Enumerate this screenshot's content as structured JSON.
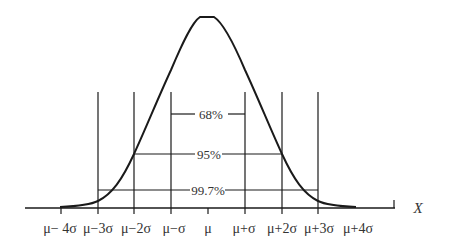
{
  "diagram": {
    "type": "normal-distribution-empirical-rule",
    "axis_label": "X",
    "tick_labels": [
      "μ− 4σ",
      "μ−3σ",
      "μ−2σ",
      "μ−σ",
      "μ",
      "μ+σ",
      "μ+2σ",
      "μ+3σ",
      "μ+4σ"
    ],
    "intervals": [
      {
        "label": "68%",
        "range": "μ±σ"
      },
      {
        "label": "95%",
        "range": "μ±2σ"
      },
      {
        "label": "99.7%",
        "range": "μ±3σ"
      }
    ],
    "colors": {
      "line": "#1a1a1a",
      "text": "#333333",
      "background": "#ffffff"
    }
  }
}
